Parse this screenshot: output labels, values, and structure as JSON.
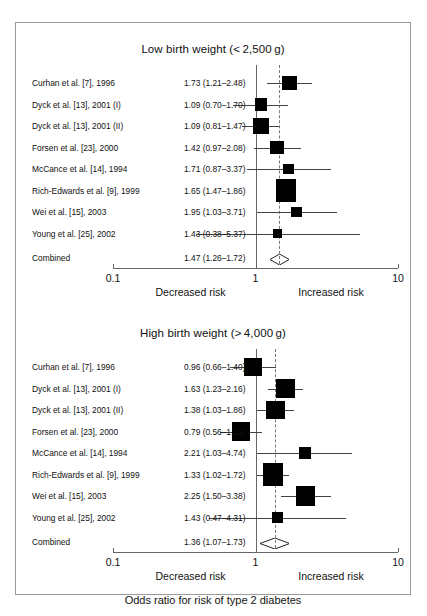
{
  "figure": {
    "x_axis": {
      "ticks": [
        "0.1",
        "1",
        "10"
      ],
      "tick_values": [
        0.1,
        1,
        10
      ],
      "left_caption": "Decreased risk",
      "right_caption": "Increased risk",
      "scale": "log"
    },
    "footer_label": "Odds ratio for risk of type 2 diabetes",
    "combined_row_label": "Combined"
  },
  "chart_data": {
    "type": "forest",
    "title": "Odds ratio for risk of type 2 diabetes",
    "xlabel": "Odds ratio for risk of type 2 diabetes",
    "xscale": "log",
    "xlim": [
      0.1,
      10
    ],
    "xticks": [
      0.1,
      1,
      10
    ],
    "xticklabels": [
      "0.1",
      "1",
      "10"
    ],
    "null_line": 1,
    "grid": false,
    "legend": "none",
    "annotations": [
      "Decreased risk",
      "Increased risk"
    ],
    "panels": [
      {
        "title": "Low birth weight (<2,500 g)",
        "title_display": "Low birth weight (< 2,500 g)",
        "effect_measure": "Odds ratio",
        "studies": [
          {
            "label": "Curhan et al. [7], 1996",
            "estimate": 1.73,
            "lower": 1.21,
            "upper": 2.48,
            "text": "1.73 (1.21–2.48)",
            "weight": 0.11
          },
          {
            "label": "Dyck et al. [13], 2001 (I)",
            "estimate": 1.09,
            "lower": 0.7,
            "upper": 1.7,
            "text": "1.09 (0.70–1.70)",
            "weight": 0.06
          },
          {
            "label": "Dyck et al. [13], 2001 (II)",
            "estimate": 1.09,
            "lower": 0.81,
            "upper": 1.47,
            "text": "1.09 (0.81–1.47)",
            "weight": 0.13
          },
          {
            "label": "Forsen et al. [23], 2000",
            "estimate": 1.42,
            "lower": 0.97,
            "upper": 2.08,
            "text": "1.42 (0.97–2.08)",
            "weight": 0.09
          },
          {
            "label": "McCance et al. [14], 1994",
            "estimate": 1.71,
            "lower": 0.87,
            "upper": 3.37,
            "text": "1.71 (0.87–3.37)",
            "weight": 0.035
          },
          {
            "label": "Rich-Edwards et al. [9], 1999",
            "estimate": 1.65,
            "lower": 1.47,
            "upper": 1.86,
            "text": "1.65 (1.47–1.86)",
            "weight": 0.55
          },
          {
            "label": "Wei et al. [15], 2003",
            "estimate": 1.95,
            "lower": 1.03,
            "upper": 3.71,
            "text": "1.95 (1.03–3.71)",
            "weight": 0.035
          },
          {
            "label": "Young et al. [25], 2002",
            "estimate": 1.43,
            "lower": 0.38,
            "upper": 5.37,
            "text": "1.43 (0.38–5.37)",
            "weight": 0.012
          }
        ],
        "combined": {
          "label": "Combined",
          "estimate": 1.47,
          "lower": 1.26,
          "upper": 1.72,
          "text": "1.47 (1.26–1.72)"
        }
      },
      {
        "title": "High birth weight (>4,000 g)",
        "title_display": "High birth weight (> 4,000 g)",
        "effect_measure": "Odds ratio",
        "studies": [
          {
            "label": "Curhan et al. [7], 1996",
            "estimate": 0.96,
            "lower": 0.66,
            "upper": 1.4,
            "text": "0.96 (0.66–1.40)",
            "weight": 0.22
          },
          {
            "label": "Dyck et al. [13], 2001 (I)",
            "estimate": 1.63,
            "lower": 1.23,
            "upper": 2.16,
            "text": "1.63 (1.23–2.16)",
            "weight": 0.26
          },
          {
            "label": "Dyck et al. [13], 2001 (II)",
            "estimate": 1.38,
            "lower": 1.03,
            "upper": 1.86,
            "text": "1.38 (1.03–1.86)",
            "weight": 0.24
          },
          {
            "label": "Forsen et al. [23], 2000",
            "estimate": 0.79,
            "lower": 0.56,
            "upper": 1.11,
            "text": "0.79 (0.56–1.11)",
            "weight": 0.23
          },
          {
            "label": "McCance et al. [14], 1994",
            "estimate": 2.21,
            "lower": 1.03,
            "upper": 4.74,
            "text": "2.21 (1.03–4.74)",
            "weight": 0.055
          },
          {
            "label": "Rich-Edwards et al. [9], 1999",
            "estimate": 1.33,
            "lower": 1.02,
            "upper": 1.72,
            "text": "1.33 (1.02–1.72)",
            "weight": 0.47
          },
          {
            "label": "Wei et al. [15], 2003",
            "estimate": 2.25,
            "lower": 1.5,
            "upper": 3.38,
            "text": "2.25 (1.50–3.38)",
            "weight": 0.26
          },
          {
            "label": "Young et al. [25], 2002",
            "estimate": 1.43,
            "lower": 0.47,
            "upper": 4.31,
            "text": "1.43 (0.47–4.31)",
            "weight": 0.035
          }
        ],
        "combined": {
          "label": "Combined",
          "estimate": 1.36,
          "lower": 1.07,
          "upper": 1.73,
          "text": "1.36 (1.07–1.73)"
        }
      }
    ]
  }
}
